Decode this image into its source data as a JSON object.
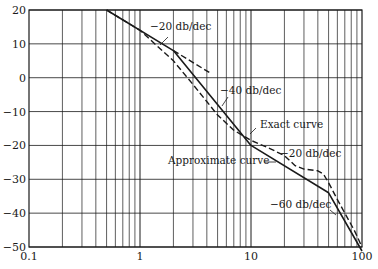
{
  "chart_data": {
    "type": "line",
    "title": "",
    "xlabel": "",
    "ylabel": "",
    "xscale": "log",
    "xlim": [
      0.1,
      100
    ],
    "ylim": [
      -50,
      20
    ],
    "grid": true,
    "x_ticks": [
      {
        "value": 0.1,
        "label": "0.1"
      },
      {
        "value": 1,
        "label": "1"
      },
      {
        "value": 10,
        "label": "10"
      },
      {
        "value": 100,
        "label": "100"
      }
    ],
    "y_ticks": [
      {
        "value": 20,
        "label": "20"
      },
      {
        "value": 10,
        "label": "10"
      },
      {
        "value": 0,
        "label": "0"
      },
      {
        "value": -10,
        "label": "−10"
      },
      {
        "value": -20,
        "label": "−20"
      },
      {
        "value": -30,
        "label": "−30"
      },
      {
        "value": -40,
        "label": "−40"
      },
      {
        "value": -50,
        "label": "−50"
      }
    ],
    "series": [
      {
        "name": "Approximate curve",
        "style": "solid",
        "x": [
          0.5,
          2,
          10,
          50,
          100
        ],
        "y": [
          20,
          8,
          -20,
          -34,
          -52
        ]
      },
      {
        "name": "Exact curve",
        "style": "dashed",
        "x": [
          0.5,
          1,
          2,
          3,
          5,
          7,
          10,
          15,
          20,
          25,
          30,
          40,
          45,
          50,
          60,
          70,
          85,
          100
        ],
        "y": [
          20,
          14,
          5,
          -2,
          -11,
          -15.5,
          -18.5,
          -21,
          -23,
          -26,
          -27,
          -27.5,
          -28.5,
          -31,
          -36,
          -40,
          -45,
          -50
        ]
      },
      {
        "name": "-20 db/dec asymptote extension",
        "style": "dashed",
        "x": [
          2,
          4.4
        ],
        "y": [
          8,
          1.2
        ]
      }
    ],
    "annotations": [
      {
        "text": "−20 db/dec",
        "x": 1.9,
        "y": 16
      },
      {
        "text": "−40 db/dec",
        "x": 5.2,
        "y": 3
      },
      {
        "text": "Exact curve",
        "x": 10.5,
        "y": -16
      },
      {
        "text": "Approximate curve",
        "x": 1.4,
        "y": -25
      },
      {
        "text": "−20 db/dec",
        "x": 17,
        "y": -24
      },
      {
        "text": "−60 db/dec",
        "x": 13,
        "y": -39
      }
    ]
  },
  "labels": {
    "ann_m20_top": "−20 db/dec",
    "ann_m40": "−40 db/dec",
    "ann_exact": "Exact curve",
    "ann_approx": "Approximate curve",
    "ann_m20_mid": "−20 db/dec",
    "ann_m60": "−60 db/dec"
  }
}
